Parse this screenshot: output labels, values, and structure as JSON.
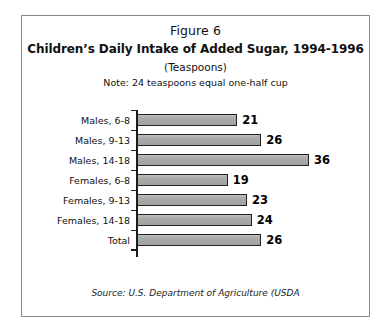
{
  "figure": {
    "number": "Figure 6",
    "title": "Children’s Daily Intake of Added Sugar, 1994-1996",
    "units": "(Teaspoons)",
    "note": "Note: 24 teaspoons equal one-half cup",
    "source": "Source: U.S. Department of Agriculture (USDA"
  },
  "chart_data": {
    "type": "bar",
    "orientation": "horizontal",
    "title": "Children’s Daily Intake of Added Sugar, 1994-1996",
    "subtitle": "(Teaspoons)",
    "annotation": "Note: 24 teaspoons equal one-half cup",
    "xlabel": "",
    "ylabel": "",
    "xlim": [
      0,
      36
    ],
    "grid": false,
    "legend": null,
    "categories": [
      "Males, 6-8",
      "Males, 9-13",
      "Males, 14-18",
      "Females, 6-8",
      "Females, 9-13",
      "Females, 14-18",
      "Total"
    ],
    "values": [
      21,
      26,
      36,
      19,
      23,
      24,
      26
    ],
    "value_labels": [
      "21",
      "26",
      "36",
      "19",
      "23",
      "24",
      "26"
    ],
    "bar_color": "#a6a6a6",
    "bar_border_color": "#232323",
    "axis_color": "#1a1a1a"
  }
}
